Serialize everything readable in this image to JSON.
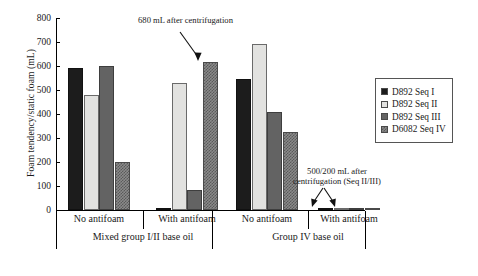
{
  "chart_data": {
    "type": "bar",
    "title": "",
    "xlabel": "",
    "ylabel": "Foam tendency/static foam (mL)",
    "ylim": [
      0,
      800
    ],
    "yticks": [
      0,
      100,
      200,
      300,
      400,
      500,
      600,
      700,
      800
    ],
    "grid": false,
    "legend_position": "right",
    "categories": [
      "No antifoam",
      "With antifoam",
      "No antifoam",
      "With antifoam"
    ],
    "groups": [
      {
        "label": "Mixed group I/II base oil",
        "categories": [
          "No antifoam",
          "With antifoam"
        ]
      },
      {
        "label": "Group IV base oil",
        "categories": [
          "No antifoam",
          "With antifoam"
        ]
      }
    ],
    "series": [
      {
        "name": "D892 Seq I",
        "color": "#1c1c1c",
        "values": [
          590,
          10,
          545,
          5
        ]
      },
      {
        "name": "D892 Seq II",
        "color": "#e2e2e0",
        "values": [
          480,
          530,
          690,
          5
        ]
      },
      {
        "name": "D892 Seq III",
        "color": "#636363",
        "values": [
          600,
          85,
          410,
          5
        ]
      },
      {
        "name": "D6082 Seq IV",
        "color": "#8a8a8a",
        "values": [
          200,
          615,
          325,
          5
        ]
      }
    ],
    "annotations": [
      {
        "text": "680 mL after centrifugation",
        "target": "group2-seq4-bar"
      },
      {
        "text_line1": "500/200 mL after",
        "text_line2": "centrifugation (Seq II/III)",
        "target": "group4-bars"
      }
    ]
  },
  "legend": {
    "items": [
      {
        "label": "D892 Seq I",
        "swatch": "seq1"
      },
      {
        "label": "D892 Seq II",
        "swatch": "seq2"
      },
      {
        "label": "D892 Seq III",
        "swatch": "seq3"
      },
      {
        "label": "D6082 Seq IV",
        "swatch": "seq4"
      }
    ]
  },
  "axis": {
    "y_title": "Foam tendency/static foam (mL)",
    "y_labels": [
      "800",
      "700",
      "600",
      "500",
      "400",
      "300",
      "200",
      "100",
      "0"
    ]
  },
  "x_axis": {
    "cat_labels": [
      "No antifoam",
      "With antifoam",
      "No antifoam",
      "With antifoam"
    ],
    "group_labels": [
      "Mixed group I/II base oil",
      "Group IV base oil"
    ]
  },
  "annotations": {
    "top": "680 mL after centrifugation",
    "bottom_line1": "500/200 mL after",
    "bottom_line2": "centrifugation (Seq II/III)"
  }
}
